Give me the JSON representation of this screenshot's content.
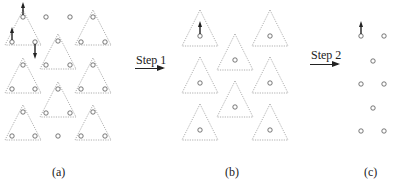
{
  "figure": {
    "panels": [
      {
        "id": "a",
        "caption": "(a)"
      },
      {
        "id": "b",
        "caption": "(b)"
      },
      {
        "id": "c",
        "caption": "(c)"
      }
    ],
    "steps": [
      {
        "label": "Step 1",
        "icon": "right-arrow-icon"
      },
      {
        "label": "Step 2",
        "icon": "right-arrow-icon"
      }
    ],
    "panel_a": {
      "description": "Triangular lattice of nodes grouped into dashed triangles; arrows indicate node movement",
      "triangles": [
        {
          "apex": [
            23,
            10
          ],
          "nodes": [
            [
              23,
              17
            ],
            [
              12,
              42
            ],
            [
              35,
              42
            ]
          ]
        },
        {
          "apex": [
            93,
            10
          ],
          "nodes": [
            [
              93,
              17
            ],
            [
              81,
              42
            ],
            [
              105,
              42
            ]
          ]
        },
        {
          "apex": [
            58,
            34
          ],
          "nodes": [
            [
              58,
              41
            ],
            [
              46,
              65
            ],
            [
              70,
              65
            ]
          ]
        },
        {
          "apex": [
            23,
            58
          ],
          "nodes": [
            [
              23,
              65
            ],
            [
              12,
              89
            ],
            [
              35,
              89
            ]
          ]
        },
        {
          "apex": [
            93,
            58
          ],
          "nodes": [
            [
              93,
              65
            ],
            [
              81,
              89
            ],
            [
              105,
              89
            ]
          ]
        },
        {
          "apex": [
            58,
            82
          ],
          "nodes": [
            [
              58,
              89
            ],
            [
              46,
              113
            ],
            [
              70,
              113
            ]
          ]
        },
        {
          "apex": [
            23,
            105
          ],
          "nodes": [
            [
              23,
              112
            ],
            [
              12,
              136
            ],
            [
              35,
              136
            ]
          ]
        },
        {
          "apex": [
            93,
            105
          ],
          "nodes": [
            [
              93,
              112
            ],
            [
              81,
              136
            ],
            [
              105,
              136
            ]
          ]
        }
      ],
      "lone_nodes": [
        [
          46,
          17
        ],
        [
          70,
          17
        ],
        [
          58,
          136
        ]
      ],
      "arrows": [
        {
          "from": [
            23,
            17
          ],
          "dir": "up"
        },
        {
          "from": [
            12,
            42
          ],
          "dir": "up"
        },
        {
          "from": [
            35,
            42
          ],
          "dir": "down"
        }
      ]
    },
    "panel_b": {
      "description": "Each triangle collapsed to a single node at its centroid",
      "triangles": [
        {
          "apex": [
            200,
            10
          ],
          "node": [
            200,
            36
          ]
        },
        {
          "apex": [
            270,
            10
          ],
          "node": [
            270,
            36
          ]
        },
        {
          "apex": [
            235,
            34
          ],
          "node": [
            235,
            60
          ]
        },
        {
          "apex": [
            200,
            57
          ],
          "node": [
            200,
            83
          ]
        },
        {
          "apex": [
            270,
            57
          ],
          "node": [
            270,
            83
          ]
        },
        {
          "apex": [
            235,
            81
          ],
          "node": [
            235,
            107
          ]
        },
        {
          "apex": [
            200,
            104
          ],
          "node": [
            200,
            130
          ]
        },
        {
          "apex": [
            270,
            104
          ],
          "node": [
            270,
            130
          ]
        }
      ],
      "arrows": [
        {
          "from": [
            200,
            36
          ],
          "dir": "up"
        }
      ]
    },
    "panel_c": {
      "description": "Resulting coarser lattice of nodes",
      "nodes": [
        [
          361,
          36
        ],
        [
          384,
          36
        ],
        [
          373,
          61
        ],
        [
          361,
          84
        ],
        [
          384,
          84
        ],
        [
          373,
          108
        ],
        [
          361,
          131
        ],
        [
          384,
          131
        ]
      ],
      "arrows": [
        {
          "from": [
            361,
            36
          ],
          "dir": "up"
        }
      ]
    },
    "colors": {
      "triangle_stroke": "#9a9a9a",
      "node_stroke": "#555555",
      "arrow": "#222222",
      "background": "#ffffff"
    }
  }
}
